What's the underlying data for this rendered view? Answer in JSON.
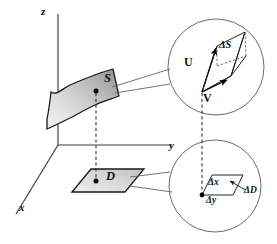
{
  "figure": {
    "background_color": "#ffffff",
    "line_color": "#1a1a1a",
    "axis_color": "#3b3b3b",
    "callout_color": "#5a5a5a"
  },
  "axes": {
    "z_label": "z",
    "y_label": "y",
    "x_label": "x"
  },
  "regions": {
    "surface_label": "S",
    "domain_label": "D"
  },
  "upper_callout": {
    "vector_u_label": "U",
    "vector_v_label": "V",
    "area_label": "ΔS"
  },
  "lower_callout": {
    "dx_label": "Δx",
    "dy_label": "Δy",
    "area_label": "ΔD"
  }
}
